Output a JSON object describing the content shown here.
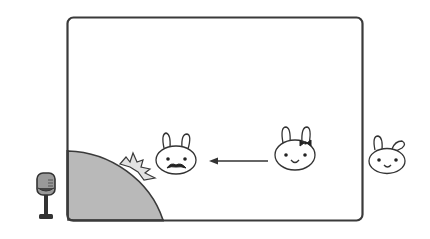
{
  "scene": {
    "description": "Stage frame with rabbits; mustached rabbit near spotlight area, bow rabbit moving left toward it, third rabbit outside frame, microphone at left",
    "colors": {
      "frame_stroke": "#3a3a3a",
      "stage_fill": "#b9b9b9",
      "burst_fill": "#e2e2e2",
      "line": "#333333",
      "background": "#ffffff"
    },
    "elements": [
      {
        "name": "microphone-icon"
      },
      {
        "name": "stage-frame"
      },
      {
        "name": "quarter-disc-stage"
      },
      {
        "name": "starburst-icon"
      },
      {
        "name": "rabbit-mustache"
      },
      {
        "name": "arrow-left"
      },
      {
        "name": "rabbit-bow"
      },
      {
        "name": "rabbit-outside"
      }
    ]
  }
}
